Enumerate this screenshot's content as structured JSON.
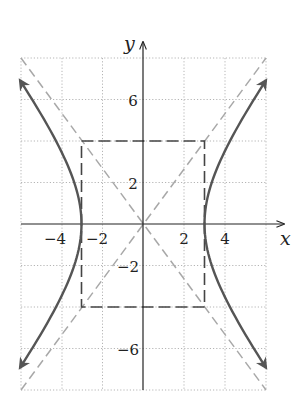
{
  "chart_data": {
    "type": "line",
    "title": "",
    "xlabel": "x",
    "ylabel": "y",
    "xlim": [
      -6,
      6
    ],
    "ylim": [
      -8,
      8
    ],
    "grid": true,
    "grid_step": 2,
    "x_ticks": [
      {
        "value": -4,
        "label": "−4"
      },
      {
        "value": -2,
        "label": "−2"
      },
      {
        "value": 2,
        "label": "2"
      },
      {
        "value": 4,
        "label": "4"
      }
    ],
    "y_ticks": [
      {
        "value": 6,
        "label": "6"
      },
      {
        "value": 2,
        "label": "2"
      },
      {
        "value": -2,
        "label": "−2"
      },
      {
        "value": -6,
        "label": "−6"
      }
    ],
    "series": [
      {
        "name": "hyperbola",
        "equation": "x^2/9 - y^2/16 = 1",
        "a": 3,
        "b": 4,
        "x_extent": 6,
        "style": "solid",
        "color": "#555555",
        "arrows": true
      },
      {
        "name": "asymptote-positive",
        "equation": "y = 4x/3",
        "style": "dashed",
        "color": "#aaaaaa"
      },
      {
        "name": "asymptote-negative",
        "equation": "y = -4x/3",
        "style": "dashed",
        "color": "#aaaaaa"
      },
      {
        "name": "fundamental-rectangle",
        "corners": [
          [
            -3,
            4
          ],
          [
            3,
            4
          ],
          [
            3,
            -4
          ],
          [
            -3,
            -4
          ]
        ],
        "style": "dashed",
        "color": "#444444"
      }
    ]
  },
  "labels": {
    "x_axis": "x",
    "y_axis": "y",
    "xt_m4": "−4",
    "xt_m2": "−2",
    "xt_2": "2",
    "xt_4": "4",
    "yt_6": "6",
    "yt_2": "2",
    "yt_m2": "−2",
    "yt_m6": "−6"
  }
}
